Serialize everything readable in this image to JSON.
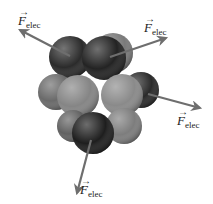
{
  "figure": {
    "background": "#ffffff",
    "arrow_color": "#6e6e6e",
    "labels": [
      {
        "id": "top-left",
        "symbol": "F",
        "vector_mark": "→",
        "subscript": "elec",
        "x": 18,
        "y": 14
      },
      {
        "id": "top-right",
        "symbol": "F",
        "vector_mark": "→",
        "subscript": "elec",
        "x": 144,
        "y": 21
      },
      {
        "id": "right",
        "symbol": "F",
        "vector_mark": "→",
        "subscript": "elec",
        "x": 177,
        "y": 114
      },
      {
        "id": "bottom",
        "symbol": "F",
        "vector_mark": "→",
        "subscript": "elec",
        "x": 80,
        "y": 183
      }
    ],
    "spheres": [
      {
        "cx": 113,
        "cy": 53,
        "r": 20,
        "fill": "#7a7a7a",
        "kind": "neutron"
      },
      {
        "cx": 70,
        "cy": 57,
        "r": 21,
        "fill": "#2b2b2b",
        "kind": "proton"
      },
      {
        "cx": 104,
        "cy": 58,
        "r": 22,
        "fill": "#232323",
        "kind": "proton"
      },
      {
        "cx": 141,
        "cy": 90,
        "r": 18,
        "fill": "#2a2a2a",
        "kind": "proton"
      },
      {
        "cx": 56,
        "cy": 92,
        "r": 18,
        "fill": "#6a6a6a",
        "kind": "neutron"
      },
      {
        "cx": 78,
        "cy": 96,
        "r": 21,
        "fill": "#858585",
        "kind": "neutron"
      },
      {
        "cx": 122,
        "cy": 95,
        "r": 21,
        "fill": "#8a8a8a",
        "kind": "neutron"
      },
      {
        "cx": 73,
        "cy": 126,
        "r": 16,
        "fill": "#616161",
        "kind": "neutron"
      },
      {
        "cx": 124,
        "cy": 126,
        "r": 18,
        "fill": "#7d7d7d",
        "kind": "neutron"
      },
      {
        "cx": 93,
        "cy": 133,
        "r": 21,
        "fill": "#1e1e1e",
        "kind": "proton"
      }
    ],
    "arrows": [
      {
        "id": "top-left",
        "x1": 70,
        "y1": 56,
        "x2": 20,
        "y2": 30
      },
      {
        "id": "top-right",
        "x1": 110,
        "y1": 57,
        "x2": 166,
        "y2": 38
      },
      {
        "id": "right",
        "x1": 148,
        "y1": 94,
        "x2": 200,
        "y2": 108
      },
      {
        "id": "bottom",
        "x1": 91,
        "y1": 140,
        "x2": 77,
        "y2": 193
      }
    ]
  }
}
